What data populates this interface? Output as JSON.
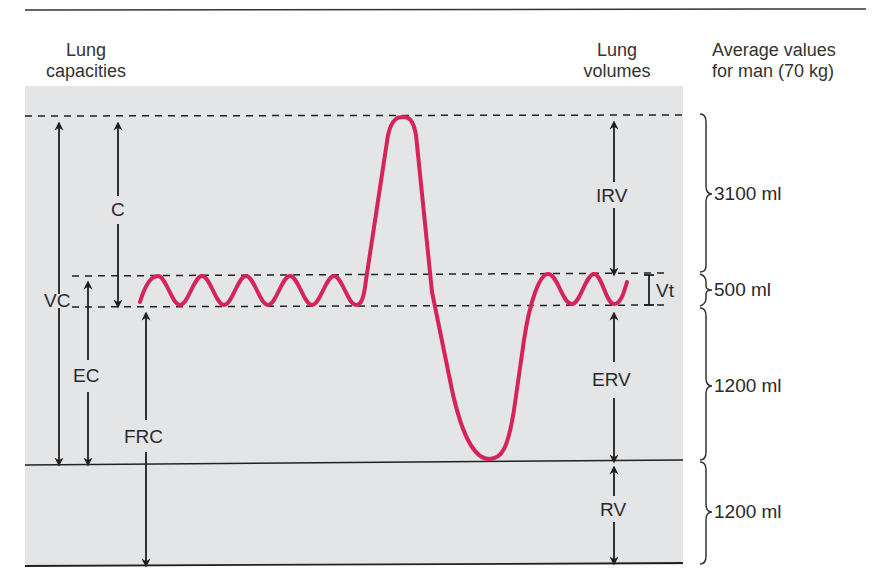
{
  "headers": {
    "capacities": [
      "Lung",
      "capacities"
    ],
    "volumes": [
      "Lung",
      "volumes"
    ],
    "averages": [
      "Average values",
      "for man (70 kg)"
    ]
  },
  "capacities": {
    "vc": "VC",
    "c": "C",
    "ec": "EC",
    "frc": "FRC"
  },
  "volumes": {
    "irv": "IRV",
    "vt": "Vt",
    "erv": "ERV",
    "rv": "RV"
  },
  "average_values": {
    "irv": "3100 ml",
    "vt": "500 ml",
    "erv": "1200 ml",
    "rv": "1200 ml"
  },
  "colors": {
    "trace": "#d6245a",
    "panel": "#e4e5e6",
    "ink": "#1e1e1e"
  }
}
